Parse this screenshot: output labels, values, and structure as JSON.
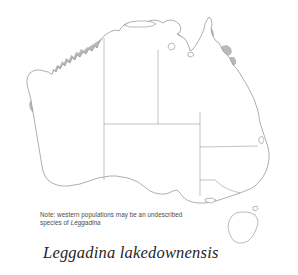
{
  "figure": {
    "kind": "species-distribution-map",
    "region": "Australia",
    "background_color": "#ffffff",
    "outline_color": "#8d8d8d",
    "border_color": "#9a9a9a",
    "range_fill_color": "#b9b9b9",
    "text_color": "#4a4a4a",
    "title_color": "#1f1f1f"
  },
  "note": {
    "line1": "Note: western populations may be an undescribed",
    "line2_prefix": "species of ",
    "line2_italic": "Leggadina"
  },
  "species": {
    "name": "Leggadina lakedownensis",
    "genus": "Leggadina",
    "epithet": "lakedownensis"
  },
  "map": {
    "landmass_label": "Australia mainland",
    "island_labels": [
      "Tasmania",
      "Melville Island",
      "Groote Eylandt",
      "Mornington Island",
      "Kangaroo Island",
      "Fraser Island"
    ],
    "state_border_label": "state and territory boundaries",
    "range_areas": [
      "Kimberley coastal region",
      "Top End and Gulf Country",
      "Cape York east coast",
      "central Queensland coast",
      "Pilbara coast",
      "inland Western Australia patch"
    ]
  }
}
